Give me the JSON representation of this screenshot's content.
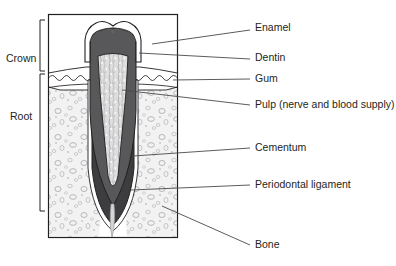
{
  "diagram": {
    "frame": {
      "x": 48,
      "y": 14,
      "width": 130,
      "height": 224
    },
    "colors": {
      "outline": "#231f20",
      "enamel": "#ffffff",
      "dentin": "#58585b",
      "pulp": "#d9d9d9",
      "gum": "#ffffff",
      "bone": "#f0f0f0",
      "cementum": "#3b3b3d",
      "ligament": "#ffffff",
      "leader": "#4a4a4a"
    },
    "left_brackets": [
      {
        "id": "crown",
        "label": "Crown",
        "label_x": 6,
        "label_y": 53,
        "top": 20,
        "bottom": 71,
        "x": 40
      },
      {
        "id": "root",
        "label": "Root",
        "label_x": 10,
        "label_y": 111,
        "top": 74,
        "bottom": 211,
        "x": 40
      }
    ],
    "callouts": [
      {
        "id": "enamel",
        "label": "Enamel",
        "text_x": 255,
        "text_y": 27,
        "line": [
          [
            152,
            44
          ],
          [
            250,
            30
          ]
        ]
      },
      {
        "id": "dentin",
        "label": "Dentin",
        "text_x": 255,
        "text_y": 56,
        "line": [
          [
            139,
            53
          ],
          [
            250,
            59
          ]
        ]
      },
      {
        "id": "gum",
        "label": "Gum",
        "text_x": 255,
        "text_y": 76,
        "line": [
          [
            173,
            80
          ],
          [
            250,
            79
          ]
        ]
      },
      {
        "id": "pulp",
        "label": "Pulp (nerve and blood supply)",
        "text_x": 255,
        "text_y": 102,
        "line": [
          [
            122,
            90
          ],
          [
            250,
            105
          ]
        ]
      },
      {
        "id": "cementum",
        "label": "Cementum",
        "text_x": 255,
        "text_y": 146,
        "line": [
          [
            133,
            156
          ],
          [
            250,
            148
          ]
        ]
      },
      {
        "id": "periodontal-ligament",
        "label": "Periodontal ligament",
        "text_x": 255,
        "text_y": 183,
        "line": [
          [
            131,
            190
          ],
          [
            250,
            185
          ]
        ]
      },
      {
        "id": "bone",
        "label": "Bone",
        "text_x": 255,
        "text_y": 243,
        "line": [
          [
            162,
            206
          ],
          [
            250,
            245
          ]
        ]
      }
    ]
  }
}
